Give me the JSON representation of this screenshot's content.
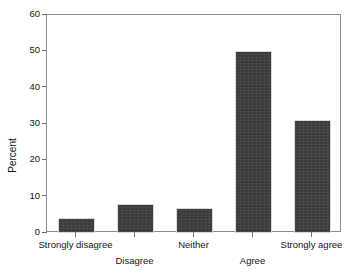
{
  "chart_data": {
    "type": "bar",
    "title": "",
    "xlabel": "",
    "ylabel": "Percent",
    "categories": [
      "Strongly disagree",
      "Disagree",
      "Neither",
      "Agree",
      "Strongly agree"
    ],
    "values": [
      4,
      8,
      7,
      50,
      31
    ],
    "ylim": [
      0,
      60
    ],
    "yticks": [
      0,
      10,
      20,
      30,
      40,
      50,
      60
    ],
    "ytick_labels": [
      "0",
      "10",
      "20",
      "30",
      "40",
      "50",
      "60"
    ],
    "grid": false,
    "legend": false,
    "bar_color": "#3b3b3b",
    "axis_color": "#8d8d8d",
    "tick_label_stagger": [
      0,
      1,
      0,
      1,
      0
    ]
  }
}
